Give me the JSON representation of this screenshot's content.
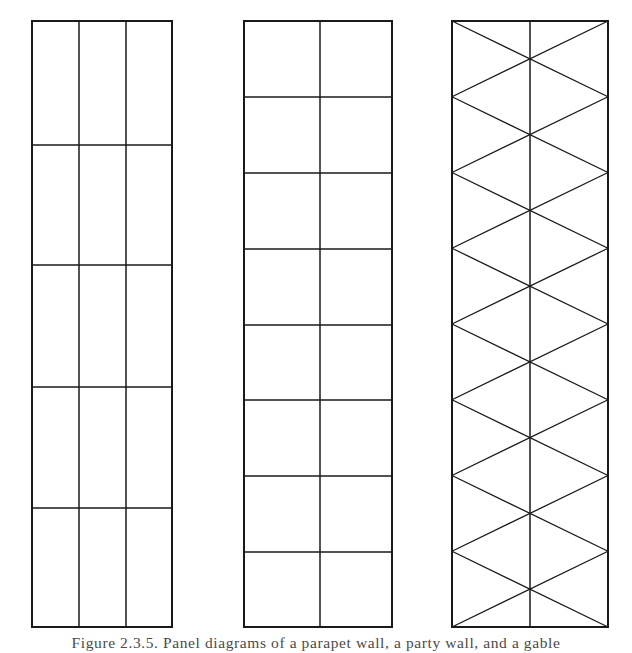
{
  "figure": {
    "caption": "Figure 2.3.5. Panel diagrams of a parapet wall, a party wall, and a gable wall",
    "caption_visible_fragment": "Figure  2.3.5.  Panel diagrams  of  a  parapet  wall,  a  party  wall,  and  a  gable",
    "background_color": "#ffffff",
    "line_color": "#1a1a1a",
    "panels": [
      {
        "id": "panel-1",
        "name": "three-column-five-row-panel",
        "label": "Left panel",
        "x": 32,
        "y": 21,
        "width": 140,
        "height": 606,
        "columns": 3,
        "rows": 5,
        "row_dividers_y": [
          145,
          265,
          387,
          508
        ],
        "column_dividers_x": [
          79,
          126
        ],
        "diagonals": false,
        "cell_count": 15
      },
      {
        "id": "panel-2",
        "name": "two-column-eight-row-panel",
        "label": "Middle panel",
        "x": 244,
        "y": 21,
        "width": 148,
        "height": 606,
        "columns": 2,
        "rows": 8,
        "row_dividers_y": [
          97,
          173,
          249,
          325,
          400,
          476,
          552
        ],
        "column_dividers_x": [
          320
        ],
        "diagonals": false,
        "cell_count": 16
      },
      {
        "id": "panel-3",
        "name": "two-column-eight-row-braced-panel",
        "label": "Right panel",
        "x": 452,
        "y": 21,
        "width": 156,
        "height": 606,
        "columns": 2,
        "rows": 8,
        "row_dividers_y": [],
        "column_dividers_x": [
          530
        ],
        "diagonals": true,
        "diagonal_pattern": "X-braces per bay, 8 stacked crosses across full width",
        "cross_count": 8
      }
    ],
    "stroke_widths": {
      "outer_frame": 2.0,
      "inner_grid": 1.5,
      "diagonal": 1.3
    }
  }
}
